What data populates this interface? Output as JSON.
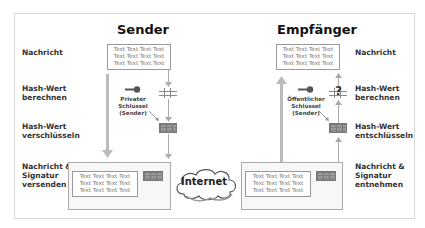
{
  "sender": {
    "title": "Sender",
    "steps": [
      {
        "label": "Nachricht"
      },
      {
        "label": "Hash-Wert\nberechnen"
      },
      {
        "label": "Hash-Wert\nverschlüsseln"
      },
      {
        "label": "Nachricht &\nSignatur\nversenden"
      }
    ],
    "message_text": "Text Text Text Text\nText Text Text Text\nText Text Text Text",
    "key_label": "Privater\nSchlüssel\n(Sender)"
  },
  "receiver": {
    "title": "Empfänger",
    "steps": [
      {
        "label": "Nachricht"
      },
      {
        "label": "Hash-Wert\nberechnen"
      },
      {
        "label": "Hash-Wert\nentschlüsseln"
      },
      {
        "label": "Nachricht &\nSignatur\nentnehmen"
      }
    ],
    "message_text": "Text Text Text Text\nText Text Text Text\nText Text Text Text",
    "key_label": "Öffentlicher\nSchlüssel\n(Sender)",
    "compare_symbol": "?"
  },
  "network": {
    "label": "Internet"
  },
  "icons": {
    "key": "key-icon",
    "hash_open": "hash-grid-icon",
    "hash_encrypted": "hash-filled-grid-icon",
    "cloud": "cloud-icon"
  },
  "colors": {
    "frame_border": "#d8d8d8",
    "arrow": "#aaaaaa",
    "thick_arrow": "#bbbbbb",
    "box_fill": "#f7f7f7",
    "text_muted": "#777777"
  }
}
